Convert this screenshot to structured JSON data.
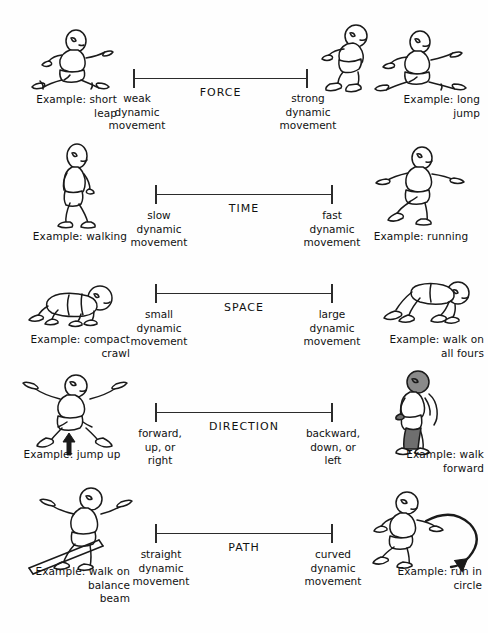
{
  "document": {
    "title": "Movement Qualities Continuum Chart",
    "background_color": "#ffffff",
    "ink_color": "#1a1a1a"
  },
  "rows": [
    {
      "id": "force",
      "scale_label": "FORCE",
      "left_pole": "weak\ndynamic\nmovement",
      "right_pole": "strong\ndynamic\nmovement",
      "left_example": "Example: short\nleap",
      "right_example": "Example: long\njump",
      "left_figure": "running-leap-figure",
      "right_figure": "long-jump-figure"
    },
    {
      "id": "time",
      "scale_label": "TIME",
      "left_pole": "slow\ndynamic\nmovement",
      "right_pole": "fast\ndynamic\nmovement",
      "left_example": "Example: walking",
      "right_example": "Example: running",
      "left_figure": "walking-figure",
      "right_figure": "running-figure"
    },
    {
      "id": "space",
      "scale_label": "SPACE",
      "left_pole": "small\ndynamic\nmovement",
      "right_pole": "large\ndynamic\nmovement",
      "left_example": "Example: compact\ncrawl",
      "right_example": "Example: walk on\nall fours",
      "left_figure": "compact-crawl-figure",
      "right_figure": "walk-all-fours-figure"
    },
    {
      "id": "direction",
      "scale_label": "DIRECTION",
      "left_pole": "forward,\nup, or\nright",
      "right_pole": "backward,\ndown, or\nleft",
      "left_example": "Example: jump up",
      "right_example": "Example: walk\nforward",
      "left_figure": "jump-up-figure",
      "right_figure": "walk-forward-figure"
    },
    {
      "id": "path",
      "scale_label": "PATH",
      "left_pole": "straight\ndynamic\nmovement",
      "right_pole": "curved\ndynamic\nmovement",
      "left_example": "Example: walk on\nbalance\nbeam",
      "right_example": "Example: run in\ncircle",
      "left_figure": "balance-beam-figure",
      "right_figure": "run-in-circle-figure"
    }
  ],
  "annotations": {
    "jump_up_arrow": "up-arrow-icon",
    "run_circle_arrow": "curved-arrow-icon"
  }
}
